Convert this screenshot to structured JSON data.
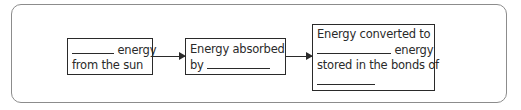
{
  "diagram": {
    "type": "flow",
    "boxes": [
      {
        "id": "box-1",
        "blank_before": "________",
        "text_line1_after_blank": " energy",
        "text_line2": "from the sun"
      },
      {
        "id": "box-2",
        "text_line1": "Energy absorbed",
        "text_line2_prefix": "by "
      },
      {
        "id": "box-3",
        "text_line1": "Energy converted to",
        "text_line2_after_blank": " energy",
        "text_line3": "stored in the bonds of"
      }
    ],
    "arrows": [
      {
        "from": "box-1",
        "to": "box-2"
      },
      {
        "from": "box-2",
        "to": "box-3"
      }
    ]
  }
}
